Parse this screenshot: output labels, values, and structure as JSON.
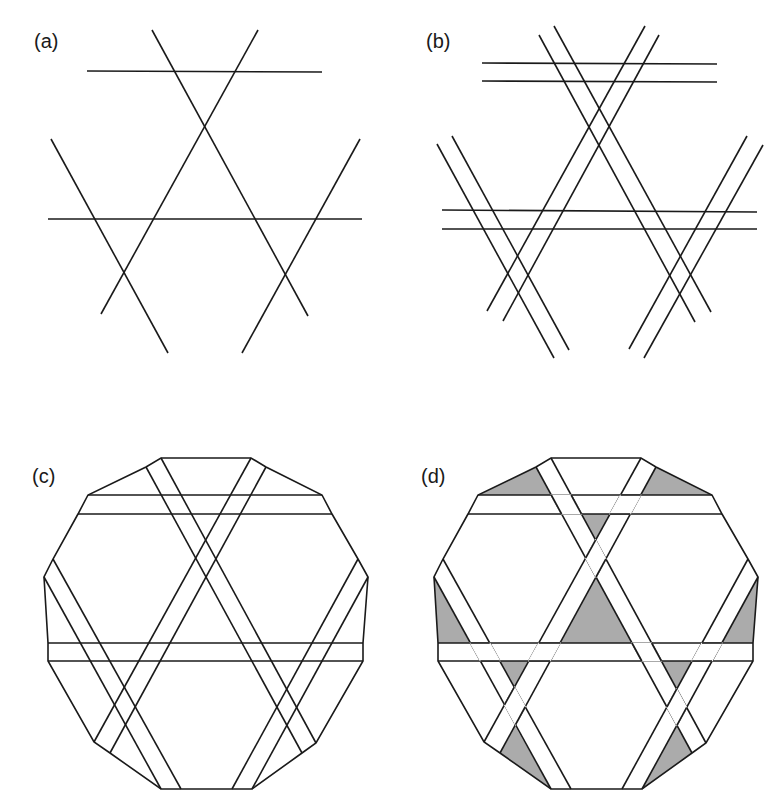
{
  "figure": {
    "stroke_color": "#1a1a1a",
    "fill_white": "#ffffff",
    "fill_gray": "#ababab",
    "stroke_width": 1.6,
    "panels": [
      {
        "id": "a",
        "label": "(a)",
        "label_pos": [
          34,
          31
        ],
        "kind": "lines",
        "segments": [
          [
            [
              87,
              71
            ],
            [
              322,
              72
            ]
          ],
          [
            [
              48,
              219
            ],
            [
              362,
              219
            ]
          ],
          [
            [
              152,
              30
            ],
            [
              308,
              316
            ]
          ],
          [
            [
              258,
              30
            ],
            [
              101,
              314
            ]
          ],
          [
            [
              51,
              139
            ],
            [
              168,
              353
            ]
          ],
          [
            [
              360,
              139
            ],
            [
              242,
              353
            ]
          ]
        ]
      },
      {
        "id": "b",
        "label": "(b)",
        "label_pos": [
          426,
          31
        ],
        "kind": "lines",
        "segments": [
          [
            [
              482,
              63
            ],
            [
              717,
              64
            ]
          ],
          [
            [
              482,
              81
            ],
            [
              717,
              82
            ]
          ],
          [
            [
              442,
              210
            ],
            [
              757,
              212
            ]
          ],
          [
            [
              442,
              229
            ],
            [
              757,
              229
            ]
          ],
          [
            [
              539,
              35
            ],
            [
              695,
              322
            ]
          ],
          [
            [
              554,
              26
            ],
            [
              711,
              312
            ]
          ],
          [
            [
              645,
              26
            ],
            [
              487,
              311
            ]
          ],
          [
            [
              659,
              35
            ],
            [
              503,
              321
            ]
          ],
          [
            [
              437,
              144
            ],
            [
              554,
              358
            ]
          ],
          [
            [
              452,
              136
            ],
            [
              569,
              350
            ]
          ],
          [
            [
              747,
              136
            ],
            [
              629,
              349
            ]
          ],
          [
            [
              763,
              145
            ],
            [
              644,
              358
            ]
          ]
        ]
      },
      {
        "id": "c",
        "label": "(c)",
        "label_pos": [
          32,
          466
        ],
        "kind": "clipped",
        "offset": [
          0,
          0
        ]
      },
      {
        "id": "d",
        "label": "(d)",
        "label_pos": [
          421,
          466
        ],
        "kind": "woven",
        "offset": [
          390,
          0
        ]
      }
    ],
    "dodecagon": [
      [
        161,
        458
      ],
      [
        251,
        458
      ],
      [
        266,
        467
      ],
      [
        322,
        495
      ],
      [
        332,
        514
      ],
      [
        358,
        559
      ],
      [
        368,
        577
      ],
      [
        363,
        643
      ],
      [
        363,
        661
      ],
      [
        316,
        743
      ],
      [
        302,
        753
      ],
      [
        252,
        789
      ],
      [
        161,
        789
      ],
      [
        110,
        753
      ],
      [
        94,
        742
      ],
      [
        48,
        661
      ],
      [
        48,
        643
      ],
      [
        44,
        577
      ],
      [
        53,
        559
      ],
      [
        78,
        514
      ],
      [
        88,
        495
      ],
      [
        146,
        467
      ]
    ],
    "strips": {
      "H_top": {
        "edges": [
          [
            [
              88,
              495
            ],
            [
              322,
              495
            ]
          ],
          [
            [
              78,
              514
            ],
            [
              332,
              514
            ]
          ]
        ]
      },
      "H_bot": {
        "edges": [
          [
            [
              48,
              643
            ],
            [
              363,
              643
            ]
          ],
          [
            [
              48,
              661
            ],
            [
              363,
              661
            ]
          ]
        ]
      },
      "DR1": {
        "edges": [
          [
            [
              146,
              467
            ],
            [
              302,
              753
            ]
          ],
          [
            [
              161,
              458
            ],
            [
              316,
              743
            ]
          ]
        ]
      },
      "DR2": {
        "edges": [
          [
            [
              44,
              577
            ],
            [
              161,
              789
            ]
          ],
          [
            [
              53,
              559
            ],
            [
              181,
              789
            ]
          ]
        ]
      },
      "UR1": {
        "edges": [
          [
            [
              251,
              458
            ],
            [
              94,
              742
            ]
          ],
          [
            [
              266,
              467
            ],
            [
              110,
              753
            ]
          ]
        ]
      },
      "UR2": {
        "edges": [
          [
            [
              358,
              559
            ],
            [
              232,
              789
            ]
          ],
          [
            [
              368,
              577
            ],
            [
              252,
              789
            ]
          ]
        ]
      }
    },
    "weave_crossings": [
      {
        "over": "DR1",
        "under": "H_top"
      },
      {
        "over": "H_top",
        "under": "UR1"
      },
      {
        "over": "UR1",
        "under": "DR1"
      },
      {
        "over": "H_bot",
        "under": "DR2"
      },
      {
        "over": "H_bot",
        "under": "UR1"
      },
      {
        "over": "DR1",
        "under": "H_bot"
      },
      {
        "over": "H_bot",
        "under": "UR2"
      },
      {
        "over": "UR1",
        "under": "DR2"
      },
      {
        "over": "UR2",
        "under": "DR1"
      }
    ],
    "gray_triangles": [
      [
        [
          146,
          467
        ],
        [
          88,
          495
        ],
        [
          161.3,
          495
        ]
      ],
      [
        [
          266,
          467
        ],
        [
          250.6,
          495
        ],
        [
          322,
          495
        ]
      ],
      [
        [
          191.5,
          514
        ],
        [
          220.3,
          514
        ],
        [
          205.8,
          540
        ]
      ],
      [
        [
          205.8,
          576.6
        ],
        [
          169.4,
          643
        ],
        [
          242,
          643
        ]
      ],
      [
        [
          44,
          577
        ],
        [
          48,
          643
        ],
        [
          80,
          643
        ]
      ],
      [
        [
          368,
          577
        ],
        [
          331.8,
          643
        ],
        [
          363,
          643
        ]
      ],
      [
        [
          108.6,
          661
        ],
        [
          139.6,
          661
        ],
        [
          124,
          689.2
        ]
      ],
      [
        [
          271.7,
          661
        ],
        [
          302,
          661
        ],
        [
          286.8,
          688.6
        ]
      ],
      [
        [
          124.4,
          724.7
        ],
        [
          110,
          753
        ],
        [
          161,
          789
        ]
      ],
      [
        [
          285.5,
          725
        ],
        [
          252,
          789
        ],
        [
          302,
          753
        ]
      ]
    ]
  }
}
